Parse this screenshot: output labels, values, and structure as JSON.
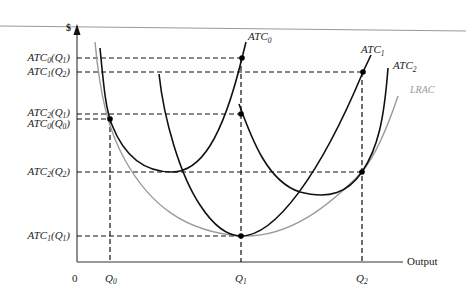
{
  "diagram": {
    "y_axis_label": "$",
    "x_axis_label": "Output",
    "origin_label": "0",
    "x_ticks": [
      {
        "id": "Q0",
        "base": "Q",
        "sub": "0"
      },
      {
        "id": "Q1",
        "base": "Q",
        "sub": "1"
      },
      {
        "id": "Q2",
        "base": "Q",
        "sub": "2"
      }
    ],
    "y_ticks": [
      {
        "id": "ATC0_Q1",
        "base": "ATC",
        "sub": "0",
        "arg": "Q",
        "argsub": "1"
      },
      {
        "id": "ATC1_Q2",
        "base": "ATC",
        "sub": "1",
        "arg": "Q",
        "argsub": "2"
      },
      {
        "id": "ATC2_Q1",
        "base": "ATC",
        "sub": "2",
        "arg": "Q",
        "argsub": "1"
      },
      {
        "id": "ATC0_Q0",
        "base": "ATC",
        "sub": "0",
        "arg": "Q",
        "argsub": "0"
      },
      {
        "id": "ATC2_Q2",
        "base": "ATC",
        "sub": "2",
        "arg": "Q",
        "argsub": "2"
      },
      {
        "id": "ATC1_Q1",
        "base": "ATC",
        "sub": "1",
        "arg": "Q",
        "argsub": "1"
      }
    ],
    "curves": [
      {
        "id": "ATC0",
        "base": "ATC",
        "sub": "0",
        "color": "#111111"
      },
      {
        "id": "ATC1",
        "base": "ATC",
        "sub": "1",
        "color": "#111111"
      },
      {
        "id": "ATC2",
        "base": "ATC",
        "sub": "2",
        "color": "#111111"
      },
      {
        "id": "LRAC",
        "label": "LRAC",
        "color": "#9a9a9a"
      }
    ]
  }
}
